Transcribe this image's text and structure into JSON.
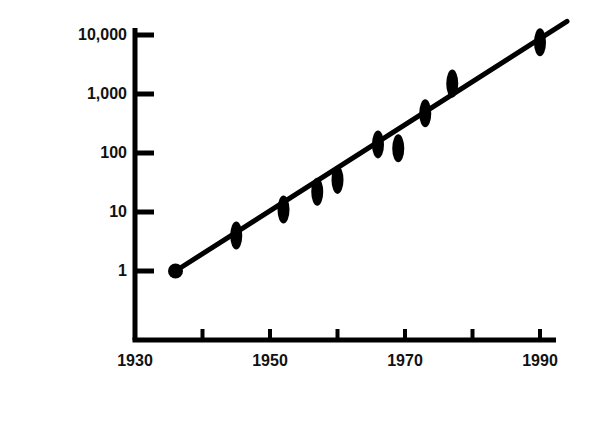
{
  "chart_data": {
    "type": "scatter",
    "title": "",
    "xlabel": "Year",
    "ylabel": "Ions influenced by defect site",
    "yscale": "log",
    "xscale": "linear",
    "grid": false,
    "legend": null,
    "xlim": [
      1930,
      1996
    ],
    "ylim": [
      1,
      10000
    ],
    "x_tick_values": [
      1930,
      1940,
      1950,
      1960,
      1970,
      1980,
      1990
    ],
    "x_tick_labels": [
      "1930",
      "",
      "1950",
      "",
      "1970",
      "",
      "1990"
    ],
    "x_labeled_ticks": [
      {
        "value": 1930,
        "label": "1930"
      },
      {
        "value": 1950,
        "label": "1950"
      },
      {
        "value": 1970,
        "label": "1970"
      },
      {
        "value": 1990,
        "label": "1990"
      }
    ],
    "y_tick_values": [
      1,
      10,
      100,
      1000,
      10000
    ],
    "y_tick_labels": [
      "1",
      "10",
      "100",
      "1,000",
      "10,000"
    ],
    "marker_style": "vertical-ellipse",
    "points": [
      {
        "x": 1936,
        "y": 1,
        "marker": "circle"
      },
      {
        "x": 1945,
        "y": 4,
        "marker": "ellipse"
      },
      {
        "x": 1952,
        "y": 11,
        "marker": "ellipse"
      },
      {
        "x": 1957,
        "y": 22,
        "marker": "ellipse"
      },
      {
        "x": 1960,
        "y": 35,
        "marker": "ellipse"
      },
      {
        "x": 1966,
        "y": 140,
        "marker": "ellipse"
      },
      {
        "x": 1969,
        "y": 120,
        "marker": "ellipse"
      },
      {
        "x": 1973,
        "y": 470,
        "marker": "ellipse"
      },
      {
        "x": 1977,
        "y": 1500,
        "marker": "ellipse"
      },
      {
        "x": 1990,
        "y": 7500,
        "marker": "ellipse"
      }
    ],
    "trend_line": {
      "type": "linear-fit-on-log-scale",
      "start": {
        "x": 1936,
        "y": 1
      },
      "end": {
        "x": 1994,
        "y": 17000
      }
    },
    "colors": {
      "foreground": "#000000",
      "background": "#ffffff",
      "marker": "#000000",
      "line": "#000000"
    }
  },
  "axes": {
    "y_title": "Ions influenced by defect site",
    "x_title": "Year"
  }
}
